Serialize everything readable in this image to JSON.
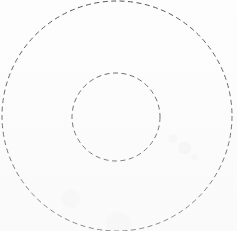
{
  "canvas": {
    "width": 237,
    "height": 231,
    "background_color": "#fdfdfd",
    "title": "Concentric dashed circles"
  },
  "style": {
    "stroke_color": "#555555",
    "stroke_color_inner": "#5a5a5a",
    "stroke_width": 1,
    "dash_length": 5,
    "gap_length": 3.5,
    "fill": "none"
  },
  "chart_data": {
    "type": "diagram",
    "title": "",
    "subtitle": "",
    "xlabel": "",
    "ylabel": "",
    "legend": [],
    "annotations": [],
    "grid": false,
    "shapes": [
      {
        "name": "outer-circle",
        "shape": "circle",
        "cx": 117,
        "cy": 116,
        "r": 115,
        "stroke": "#555555",
        "stroke_width": 1,
        "dash": "5 3.5",
        "fill": "none",
        "cropped": true
      },
      {
        "name": "inner-circle",
        "shape": "circle",
        "cx": 116,
        "cy": 117,
        "r": 44,
        "stroke": "#5a5a5a",
        "stroke_width": 1,
        "dash": "5 3.5",
        "fill": "none",
        "cropped": false
      }
    ]
  }
}
